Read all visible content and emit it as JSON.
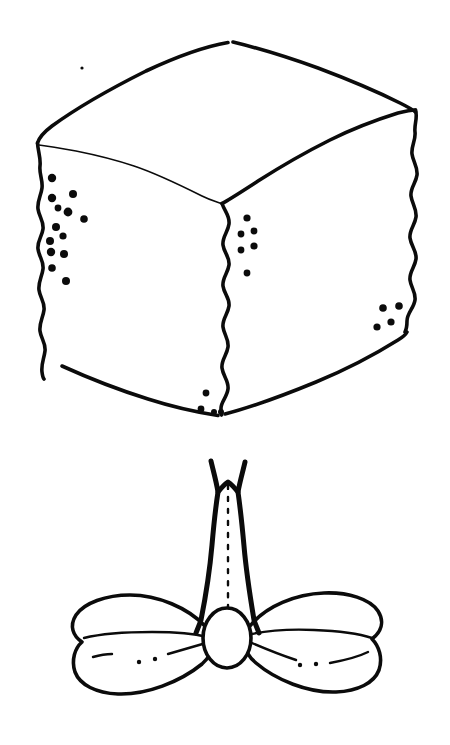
{
  "figure": {
    "background_color": "#ffffff",
    "ink_color": "#0b0b0b",
    "width": 450,
    "height": 745,
    "style": "hand-drawn pen-and-ink scientific illustration",
    "caption": ""
  },
  "objects": {
    "cube": {
      "name": "cube-shaped-object",
      "description": "Irregular hand-drawn cube seen from above-left, three faces visible",
      "faces": [
        "top",
        "front-left",
        "front-right"
      ],
      "top_apex": [
        232,
        42
      ],
      "top_left_corner": [
        37,
        143
      ],
      "top_right_corner": [
        415,
        108
      ],
      "front_center_vertex": [
        222,
        203
      ],
      "bottom_left_corner": [
        60,
        375
      ],
      "bottom_center": [
        222,
        415
      ],
      "bottom_right_corner": [
        405,
        330
      ],
      "dot_clusters": [
        {
          "name": "left-edge-dot-cluster",
          "count": 13,
          "dots": [
            {
              "cx": 52,
              "cy": 178,
              "r": 4.2
            },
            {
              "cx": 73,
              "cy": 194,
              "r": 4.0
            },
            {
              "cx": 52,
              "cy": 198,
              "r": 4.2
            },
            {
              "cx": 68,
              "cy": 212,
              "r": 4.4
            },
            {
              "cx": 56,
              "cy": 227,
              "r": 4.0
            },
            {
              "cx": 84,
              "cy": 219,
              "r": 3.8
            },
            {
              "cx": 50,
              "cy": 241,
              "r": 4.0
            },
            {
              "cx": 63,
              "cy": 236,
              "r": 3.6
            },
            {
              "cx": 51,
              "cy": 252,
              "r": 4.2
            },
            {
              "cx": 64,
              "cy": 254,
              "r": 4.0
            },
            {
              "cx": 52,
              "cy": 268,
              "r": 3.8
            },
            {
              "cx": 66,
              "cy": 281,
              "r": 4.0
            },
            {
              "cx": 58,
              "cy": 208,
              "r": 3.4
            }
          ]
        },
        {
          "name": "center-edge-dot-cluster",
          "count": 6,
          "dots": [
            {
              "cx": 247,
              "cy": 218,
              "r": 3.6
            },
            {
              "cx": 254,
              "cy": 231,
              "r": 3.4
            },
            {
              "cx": 241,
              "cy": 234,
              "r": 3.4
            },
            {
              "cx": 254,
              "cy": 246,
              "r": 3.6
            },
            {
              "cx": 241,
              "cy": 250,
              "r": 3.4
            },
            {
              "cx": 247,
              "cy": 273,
              "r": 3.4
            }
          ]
        },
        {
          "name": "right-edge-dot-cluster",
          "count": 4,
          "dots": [
            {
              "cx": 383,
              "cy": 308,
              "r": 3.8
            },
            {
              "cx": 399,
              "cy": 306,
              "r": 3.8
            },
            {
              "cx": 391,
              "cy": 322,
              "r": 3.6
            },
            {
              "cx": 377,
              "cy": 327,
              "r": 3.6
            }
          ]
        },
        {
          "name": "bottom-edge-dot-cluster",
          "count": 4,
          "dots": [
            {
              "cx": 206,
              "cy": 393,
              "r": 3.4
            },
            {
              "cx": 201,
              "cy": 409,
              "r": 3.4
            },
            {
              "cx": 214,
              "cy": 412,
              "r": 3.0
            },
            {
              "cx": 221,
              "cy": 412,
              "r": 3.0
            }
          ]
        },
        {
          "name": "isolated-speck",
          "count": 1,
          "dots": [
            {
              "cx": 82,
              "cy": 68,
              "r": 1.6
            }
          ]
        }
      ]
    },
    "bowtie": {
      "name": "bow-tie-structure",
      "description": "Bilobed bow-tie / butterfly shaped body with a tapering forked stalk rising from the central bead",
      "stalk": {
        "name": "forked-stalk",
        "top_y": 460,
        "bottom_y": 625,
        "fork_tips": [
          [
            212,
            462
          ],
          [
            243,
            463
          ]
        ],
        "center_dotted_line": true
      },
      "center_bead": {
        "name": "central-bead",
        "cx": 227,
        "cy": 638,
        "rx": 24,
        "ry": 30
      },
      "left_wing": {
        "name": "left-wing",
        "bounds": [
          72,
          595,
          215,
          690
        ],
        "fold_line": true,
        "dots": [
          {
            "cx": 139,
            "cy": 662,
            "r": 2.2
          },
          {
            "cx": 155,
            "cy": 659,
            "r": 2.2
          }
        ]
      },
      "right_wing": {
        "name": "right-wing",
        "bounds": [
          240,
          595,
          382,
          690
        ],
        "fold_line": true,
        "dots": [
          {
            "cx": 300,
            "cy": 665,
            "r": 2.2
          },
          {
            "cx": 316,
            "cy": 664,
            "r": 2.2
          }
        ]
      }
    }
  },
  "labels": {
    "cube_label": "",
    "bowtie_label": ""
  }
}
